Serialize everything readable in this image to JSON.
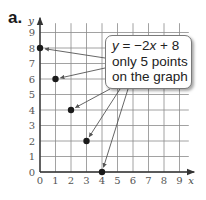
{
  "part_label": "a.",
  "callout": {
    "equation_y": "y",
    "equation_rest": " = −2",
    "equation_x": "x",
    "equation_tail": " + 8",
    "line2": "only 5 points",
    "line3": "on the graph"
  },
  "colors": {
    "grid": "#8a8a8a",
    "axis": "#333333",
    "point": "#1a1a1a",
    "arrow": "#555555"
  },
  "chart_data": {
    "type": "scatter",
    "title": "",
    "xlabel": "x",
    "ylabel": "y",
    "xlim": [
      0,
      9
    ],
    "ylim": [
      0,
      9
    ],
    "grid": true,
    "x_ticks": [
      "0",
      "1",
      "2",
      "3",
      "4",
      "5",
      "6",
      "7",
      "8",
      "9"
    ],
    "y_ticks": [
      "0",
      "1",
      "2",
      "3",
      "4",
      "5",
      "6",
      "7",
      "8",
      "9"
    ],
    "series": [
      {
        "name": "y = -2x + 8",
        "points": [
          [
            0,
            8
          ],
          [
            1,
            6
          ],
          [
            2,
            4
          ],
          [
            3,
            2
          ],
          [
            4,
            0
          ]
        ]
      }
    ],
    "annotation": "y = −2x + 8 only 5 points on the graph"
  }
}
